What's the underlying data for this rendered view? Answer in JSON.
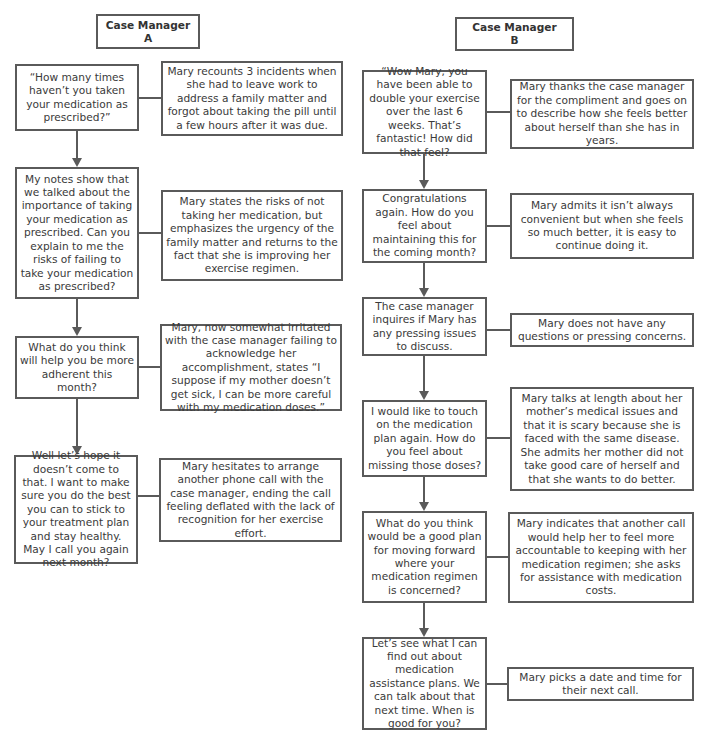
{
  "columns": [
    {
      "header": {
        "title": "Case Manager",
        "label": "A"
      },
      "steps": [
        {
          "manager": "“How many times haven’t you taken your medication as prescribed?”",
          "mary": "Mary recounts 3 incidents when she had to leave work to address a family matter and forgot about taking the pill until a few hours after it was due."
        },
        {
          "manager": "My notes show that we talked about the importance of taking your medication as prescribed. Can you explain to me the risks of failing to take your medication as prescribed?",
          "mary": "Mary states the risks of not taking her medication, but emphasizes the urgency of the family matter and returns to the fact that she is improving her exercise regimen."
        },
        {
          "manager": "What do you think will help you be more adherent this month?",
          "mary": "Mary, now somewhat irritated with the case manager failing to acknowledge her accomplishment, states “I suppose if my mother doesn’t get sick, I can be more careful with my medication doses.”"
        },
        {
          "manager": "Well let’s hope it doesn’t come to that. I want to make sure you do the best you can to stick to your treatment plan and stay healthy. May I call you again next month?",
          "mary": "Mary hesitates to arrange another phone call with the case manager, ending the call feeling deflated with the lack of recognition for her exercise effort."
        }
      ]
    },
    {
      "header": {
        "title": "Case Manager",
        "label": "B"
      },
      "steps": [
        {
          "manager": "“Wow Mary, you have been able to double your exercise over the last 6 weeks. That’s fantastic! How did that feel?",
          "mary": "Mary thanks the case manager for the compliment and goes on to describe how she feels better about herself than she has in years."
        },
        {
          "manager": "Congratulations again. How do you feel about maintaining this for the coming month?",
          "mary": "Mary admits it isn’t always convenient but when she feels so much better, it is easy to continue doing it."
        },
        {
          "manager": "The case manager inquires if Mary has any pressing issues to discuss.",
          "mary": "Mary does not have any questions or pressing concerns."
        },
        {
          "manager": "I would like to touch on the medication plan again. How do you feel about missing those doses?",
          "mary": "Mary talks at length about her mother’s medical issues and that it is scary because she is faced with the same disease. She admits her mother did not take good care of herself and that she wants to do better."
        },
        {
          "manager": "What do you think would be a good plan for moving forward where your medication regimen is concerned?",
          "mary": "Mary indicates that another call would help her to feel more accountable to keeping with her medication regimen; she asks for assistance with medication costs."
        },
        {
          "manager": "Let’s see what I can find out about medication assistance plans. We can talk about that next time. When is good for you?",
          "mary": "Mary picks a date and time for their next call."
        }
      ]
    }
  ]
}
